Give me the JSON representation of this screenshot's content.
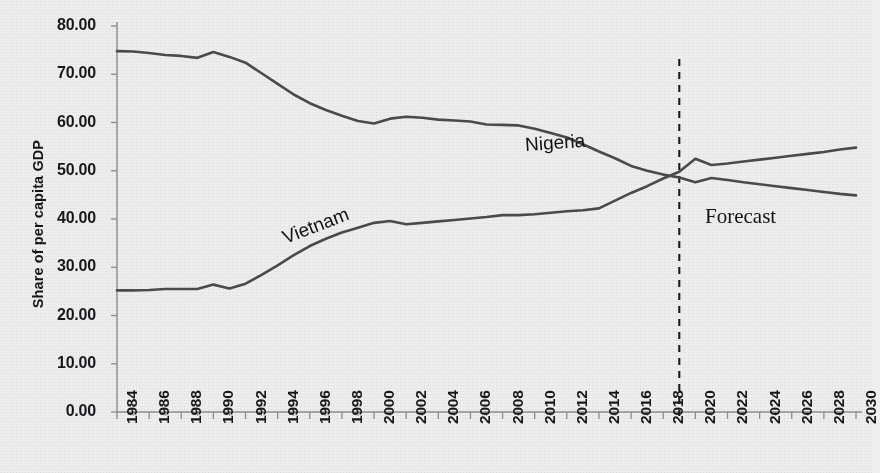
{
  "chart_data": {
    "type": "line",
    "title": "",
    "xlabel": "",
    "ylabel": "Share of per capita GDP",
    "xlim": [
      1984,
      2030
    ],
    "ylim": [
      0,
      80
    ],
    "ytick_labels": [
      "80.00",
      "70.00",
      "60.00",
      "50.00",
      "40.00",
      "30.00",
      "20.00",
      "10.00",
      "0.00"
    ],
    "ytick_values": [
      80,
      70,
      60,
      50,
      40,
      30,
      20,
      10,
      0
    ],
    "xtick_labels": [
      "1984",
      "1986",
      "1988",
      "1990",
      "1992",
      "1994",
      "1996",
      "1998",
      "2000",
      "2002",
      "2004",
      "2006",
      "2008",
      "2010",
      "2012",
      "2014",
      "2016",
      "2018",
      "2020",
      "2022",
      "2024",
      "2026",
      "2028",
      "2030"
    ],
    "xtick_values": [
      1984,
      1986,
      1988,
      1990,
      1992,
      1994,
      1996,
      1998,
      2000,
      2002,
      2004,
      2006,
      2008,
      2010,
      2012,
      2014,
      2016,
      2018,
      2020,
      2022,
      2024,
      2026,
      2028,
      2030
    ],
    "grid": false,
    "legend_position": "inline-annotations",
    "line_color": "#4a4a4a",
    "annotations": [
      {
        "text": "Nigeria",
        "series": "Nigeria",
        "x": 2006,
        "y": 55.5
      },
      {
        "text": "Vietnam",
        "series": "Vietnam",
        "x": 1994,
        "y": 41.5
      },
      {
        "text": "Forecast",
        "x": 2024,
        "y": 37.0
      }
    ],
    "forecast_divider": {
      "x": 2019,
      "style": "dashed",
      "color": "#1c1c1c"
    },
    "x": [
      1984,
      1985,
      1986,
      1987,
      1988,
      1989,
      1990,
      1991,
      1992,
      1993,
      1994,
      1995,
      1996,
      1997,
      1998,
      1999,
      2000,
      2001,
      2002,
      2003,
      2004,
      2005,
      2006,
      2007,
      2008,
      2009,
      2010,
      2011,
      2012,
      2013,
      2014,
      2015,
      2016,
      2017,
      2018,
      2019,
      2020,
      2021,
      2022,
      2023,
      2024,
      2025,
      2026,
      2027,
      2028,
      2029,
      2030
    ],
    "series": [
      {
        "name": "Nigeria",
        "values": [
          74.8,
          74.7,
          74.4,
          74.0,
          73.8,
          73.4,
          74.6,
          73.6,
          72.4,
          70.2,
          68.0,
          65.8,
          64.0,
          62.6,
          61.4,
          60.3,
          59.8,
          60.8,
          61.2,
          61.0,
          60.6,
          60.4,
          60.2,
          59.6,
          59.5,
          59.4,
          58.7,
          57.8,
          56.9,
          55.5,
          54.0,
          52.6,
          51.0,
          50.0,
          49.2,
          48.6,
          47.6,
          48.5,
          48.1,
          47.6,
          47.2,
          46.8,
          46.4,
          46.0,
          45.6,
          45.2,
          44.9
        ]
      },
      {
        "name": "Vietnam",
        "values": [
          25.2,
          25.2,
          25.3,
          25.5,
          25.5,
          25.5,
          26.4,
          25.6,
          26.6,
          28.4,
          30.4,
          32.5,
          34.4,
          35.9,
          37.2,
          38.2,
          39.2,
          39.6,
          38.9,
          39.2,
          39.5,
          39.8,
          40.1,
          40.4,
          40.8,
          40.8,
          41.0,
          41.3,
          41.6,
          41.8,
          42.2,
          43.8,
          45.4,
          46.8,
          48.4,
          49.8,
          52.5,
          51.2,
          51.5,
          51.9,
          52.3,
          52.7,
          53.1,
          53.5,
          53.9,
          54.4,
          54.8
        ]
      }
    ]
  }
}
